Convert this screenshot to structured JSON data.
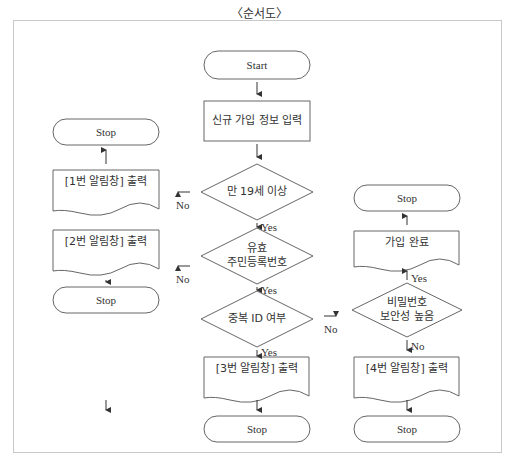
{
  "title": "〈순서도〉",
  "nodes": {
    "start": "Start",
    "input": "신규 가입 정보 입력",
    "age_check": "만 19세 이상",
    "resident_check_line1": "유효",
    "resident_check_line2": "주민등록번호",
    "dup_id_check": "중복 ID 여부",
    "alert1": "[1번 알림창] 출력",
    "alert2": "[2번 알림창] 출력",
    "alert3": "[3번 알림창] 출력",
    "alert4": "[4번 알림창] 출력",
    "pw_check_line1": "비밀번호",
    "pw_check_line2": "보안성 높음",
    "join_complete": "가입 완료",
    "stop1": "Stop",
    "stop2": "Stop",
    "stop3": "Stop",
    "stop4": "Stop",
    "stop5": "Stop"
  },
  "edges": {
    "age_no": "No",
    "age_yes": "Yes",
    "resident_no": "No",
    "resident_yes": "Yes",
    "dup_no": "No",
    "dup_yes": "Yes",
    "pw_yes": "Yes",
    "pw_no": "No"
  },
  "colors": {
    "stroke": "#555555",
    "border": "#c8c8c8",
    "text": "#333333"
  }
}
